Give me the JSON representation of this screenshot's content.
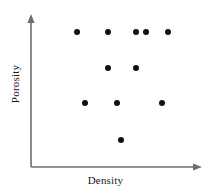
{
  "chart_data": {
    "type": "scatter",
    "title": "",
    "xlabel": "Density",
    "ylabel": "Porosity",
    "grid": false,
    "legend": null,
    "xlim": [
      0,
      100
    ],
    "ylim": [
      0,
      100
    ],
    "axis_style": "arrow-axes-no-ticks",
    "marker": {
      "shape": "circle",
      "color": "#111111",
      "radius_px": 3
    },
    "series": [
      {
        "name": "samples",
        "points": [
          {
            "x": 27,
            "y": 89,
            "px": 77,
            "py": 32
          },
          {
            "x": 46,
            "y": 89,
            "px": 108,
            "py": 32
          },
          {
            "x": 62,
            "y": 89,
            "px": 136,
            "py": 32
          },
          {
            "x": 68,
            "y": 89,
            "px": 146,
            "py": 32
          },
          {
            "x": 81,
            "y": 89,
            "px": 168,
            "py": 32
          },
          {
            "x": 46,
            "y": 65,
            "px": 108,
            "py": 68
          },
          {
            "x": 62,
            "y": 65,
            "px": 136,
            "py": 68
          },
          {
            "x": 32,
            "y": 42,
            "px": 85,
            "py": 103
          },
          {
            "x": 51,
            "y": 42,
            "px": 117,
            "py": 103
          },
          {
            "x": 77,
            "y": 42,
            "px": 162,
            "py": 103
          },
          {
            "x": 51,
            "y": 20,
            "px": 121,
            "py": 140
          }
        ]
      }
    ]
  },
  "axes": {
    "color": "#6e6e6e",
    "origin_px": {
      "x": 31,
      "y": 167
    },
    "y_top_px": 16,
    "x_right_px": 200
  },
  "labels": {
    "x_axis": "Density",
    "y_axis": "Porosity"
  }
}
